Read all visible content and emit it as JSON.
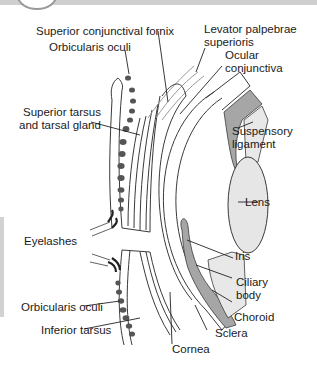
{
  "diagram": {
    "labels": {
      "superior_conjunctival_fornix": "Superior conjunctival fornix",
      "orbicularis_oculi_upper": "Orbicularis oculi",
      "levator_line1": "Levator palpebrae",
      "levator_line2": "superioris",
      "ocular_conjunctiva_line1": "Ocular",
      "ocular_conjunctiva_line2": "conjunctiva",
      "superior_tarsus_line1": "Superior tarsus",
      "superior_tarsus_line2": "and tarsal gland",
      "suspensory_line1": "Suspensory",
      "suspensory_line2": "ligament",
      "lens": "Lens",
      "eyelashes": "Eyelashes",
      "iris": "Iris",
      "ciliary_line1": "Ciliary",
      "ciliary_line2": "body",
      "choroid": "Choroid",
      "orbicularis_oculi_lower": "Orbicularis oculi",
      "sclera": "Sclera",
      "inferior_tarsus": "Inferior tarsus",
      "cornea": "Cornea"
    },
    "colors": {
      "line": "#3a3a3a",
      "dark_fill": "#a0a0a0",
      "light_fill": "#e6e6e6",
      "gland_dots": "#555555",
      "header_band": "#cfcfcf"
    }
  }
}
